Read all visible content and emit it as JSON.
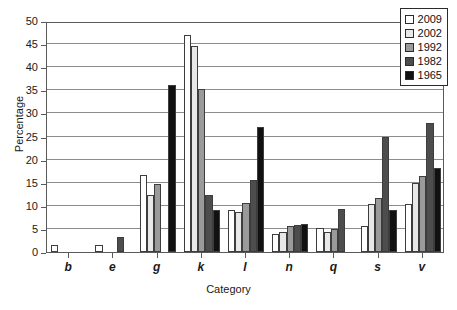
{
  "chart_data": {
    "type": "bar",
    "title": "",
    "xlabel": "Category",
    "ylabel": "Percentage",
    "ylim": [
      0,
      50
    ],
    "yticks": [
      0,
      5,
      10,
      15,
      20,
      25,
      30,
      35,
      40,
      45,
      50
    ],
    "grid": true,
    "legend_position": "top-right",
    "categories": [
      "b",
      "e",
      "g",
      "k",
      "l",
      "n",
      "q",
      "s",
      "v"
    ],
    "series": [
      {
        "name": "2009",
        "color": "#ffffff",
        "values": [
          1.5,
          1.5,
          16.6,
          47.0,
          9.0,
          3.8,
          5.2,
          5.7,
          10.4
        ]
      },
      {
        "name": "2002",
        "color": "#e8e8e8",
        "values": [
          0,
          0,
          12.3,
          44.6,
          8.6,
          4.4,
          4.4,
          10.3,
          14.9
        ]
      },
      {
        "name": "1992",
        "color": "#9a9a9a",
        "values": [
          0,
          0,
          14.7,
          35.2,
          10.6,
          5.6,
          4.9,
          11.7,
          16.4
        ]
      },
      {
        "name": "1982",
        "color": "#4d4d4d",
        "values": [
          0,
          3.2,
          0,
          12.4,
          15.6,
          5.9,
          9.3,
          24.9,
          27.9
        ]
      },
      {
        "name": "1965",
        "color": "#111111",
        "values": [
          0,
          0,
          36.2,
          9.0,
          27.1,
          6.1,
          0,
          9.1,
          18.1
        ]
      }
    ]
  }
}
